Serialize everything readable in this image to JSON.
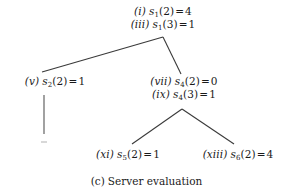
{
  "figure": {
    "caption_label": "(c)",
    "caption_text": "Server evaluation",
    "background_color": "#ffffff",
    "line_color": "#3a3a3a",
    "text_color": "#1a1a1a"
  },
  "tree": {
    "nodes": [
      {
        "id": "root",
        "lines": [
          {
            "step": "(i)",
            "symbol": "s",
            "subscript": "1",
            "argument": "(2)",
            "equals": "=",
            "value": "4"
          },
          {
            "step": "(iii)",
            "symbol": "s",
            "subscript": "1",
            "argument": "(3)",
            "equals": "=",
            "value": "1"
          }
        ]
      },
      {
        "id": "s2",
        "lines": [
          {
            "step": "(v)",
            "symbol": "s",
            "subscript": "2",
            "argument": "(2)",
            "equals": "=",
            "value": "1"
          }
        ]
      },
      {
        "id": "s4",
        "lines": [
          {
            "step": "(vii)",
            "symbol": "s",
            "subscript": "4",
            "argument": "(2)",
            "equals": "=",
            "value": "0"
          },
          {
            "step": "(ix)",
            "symbol": "s",
            "subscript": "4",
            "argument": "(3)",
            "equals": "=",
            "value": "1"
          }
        ]
      },
      {
        "id": "s5",
        "lines": [
          {
            "step": "(xi)",
            "symbol": "s",
            "subscript": "5",
            "argument": "(2)",
            "equals": "=",
            "value": "1"
          }
        ]
      },
      {
        "id": "s6",
        "lines": [
          {
            "step": "(xiii)",
            "symbol": "s",
            "subscript": "6",
            "argument": "(2)",
            "equals": "=",
            "value": "4"
          }
        ]
      }
    ],
    "edges": [
      {
        "from": "root",
        "to": "s2"
      },
      {
        "from": "root",
        "to": "s4"
      },
      {
        "from": "s2",
        "to": "stub"
      },
      {
        "from": "s4",
        "to": "s5"
      },
      {
        "from": "s4",
        "to": "s6"
      }
    ]
  }
}
